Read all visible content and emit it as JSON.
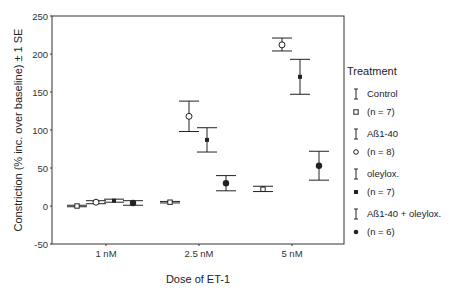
{
  "chart_data": {
    "type": "scatter",
    "subtype": "grouped-means-with-error-bars",
    "title": "",
    "xlabel": "Dose of ET-1",
    "ylabel": "Constriction (% inc. over baseline) ± 1 SE",
    "ylim": [
      -50,
      250
    ],
    "yticks": [
      250,
      200,
      150,
      100,
      50,
      0,
      -50
    ],
    "categories": [
      "1 nM",
      "2.5 nM",
      "5 nM"
    ],
    "grid": false,
    "legend_position": "right",
    "legend_title": "Treatment",
    "series": [
      {
        "name": "Control",
        "n_label": "(n = 7)",
        "marker": "open-square",
        "values": [
          0,
          5,
          22
        ],
        "se_low": [
          -1,
          4,
          19
        ],
        "se_high": [
          1,
          6,
          26
        ]
      },
      {
        "name": "Aß1-40",
        "n_label": "(n = 8)",
        "marker": "open-circle",
        "values": [
          5,
          118,
          212
        ],
        "se_low": [
          3,
          98,
          204
        ],
        "se_high": [
          7,
          138,
          221
        ]
      },
      {
        "name": "oleylox.",
        "n_label": "(n = 7)",
        "marker": "filled-square",
        "values": [
          7,
          87,
          170
        ],
        "se_low": [
          5,
          71,
          147
        ],
        "se_high": [
          9,
          103,
          193
        ]
      },
      {
        "name": "Aß1-40 + oleylox.",
        "n_label": "(n = 6)",
        "marker": "filled-circle",
        "values": [
          4,
          30,
          53
        ],
        "se_low": [
          1,
          20,
          34
        ],
        "se_high": [
          7,
          40,
          72
        ]
      }
    ]
  },
  "colors": {
    "ink": "#222222",
    "axis": "#333333",
    "background": "#ffffff"
  }
}
